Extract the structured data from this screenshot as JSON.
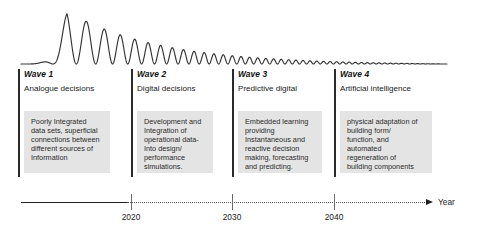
{
  "figure": {
    "wave_curve": {
      "description": "damped oscillating sine wave decaying left to right",
      "color": "#333333",
      "baseline_y": 64,
      "start_x": 21,
      "end_x": 447,
      "peak_x": 67,
      "peak_y": 11
    },
    "waves": [
      {
        "id": "wave-1",
        "heading": "Wave 1",
        "subtitle": "Analogue decisions",
        "body": "Poorly Integrated\ndata sets, superficial\nconnections between\ndifferent sources of\nInformation",
        "left_px": 18
      },
      {
        "id": "wave-2",
        "heading": "Wave 2",
        "subtitle": "Digital decisions",
        "body": "Development and\nIntegration of\noperational data-\nInto design/\nperformance\nsimulations.",
        "left_px": 131
      },
      {
        "id": "wave-3",
        "heading": "Wave 3",
        "subtitle": "Predictive digital",
        "body": "Embedded learning\nproviding\nInstantaneous and\nreactive decision\nmaking, forecasting\nand predicting.",
        "left_px": 232
      },
      {
        "id": "wave-4",
        "heading": "Wave 4",
        "subtitle": "Artificial intelligence",
        "body": "physical adaptation of\nbuilding form/\nfunction, and\nautomated\nregeneration of\nbuilding components",
        "left_px": 334
      }
    ],
    "axis": {
      "label": "Year",
      "ticks": [
        {
          "label": "2020",
          "x": 131
        },
        {
          "label": "2030",
          "x": 232
        },
        {
          "label": "2040",
          "x": 334
        }
      ],
      "solid_segment": {
        "from_x": 21,
        "to_x": 127
      },
      "dotted_segment": {
        "from_x": 127,
        "to_x": 427
      },
      "arrow_x": 426
    },
    "colors": {
      "box_fill": "#e4e4e4",
      "rule": "#2a2a2a",
      "axis": "#1f1f1f",
      "text": "#222222"
    }
  },
  "chart_data": {
    "type": "line",
    "xlabel": "Year",
    "ylabel": "",
    "grid": false,
    "legend": "none",
    "xticks": [
      "2020",
      "2030",
      "2040"
    ],
    "annotations": [
      "Wave 1 — Analogue decisions",
      "Wave 2 — Digital decisions",
      "Wave 3 — Predictive digital",
      "Wave 4 — Artificial intelligence"
    ],
    "series": [
      {
        "name": "damped oscillation",
        "description": "amplitude decays exponentially while frequency increases left-to-right",
        "x": [
          0,
          5,
          10,
          15,
          20,
          25,
          30,
          35,
          40,
          45,
          50,
          55,
          60,
          65,
          70,
          75,
          80,
          85,
          90,
          95,
          100
        ],
        "values": [
          0,
          0.04,
          0.18,
          1.0,
          0.1,
          0.62,
          0.06,
          0.45,
          0.05,
          0.34,
          0.04,
          0.26,
          0.03,
          0.2,
          0.03,
          0.15,
          0.02,
          0.1,
          0.02,
          0.05,
          0.0
        ]
      }
    ]
  }
}
